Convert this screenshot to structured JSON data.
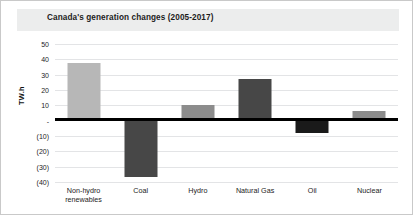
{
  "chart_data": {
    "type": "bar",
    "title": "Canada's generation changes (2005-2017)",
    "xlabel": "",
    "ylabel": "TW.h",
    "categories": [
      "Non-hydro renewables",
      "Coal",
      "Hydro",
      "Natural Gas",
      "Oil",
      "Nuclear"
    ],
    "values": [
      37.5,
      -36.5,
      10,
      27,
      -8,
      6
    ],
    "bar_colors": [
      "#b7b7b7",
      "#474747",
      "#8c8c8c",
      "#474747",
      "#1a1a1a",
      "#8c8c8c"
    ],
    "ylim": [
      -40,
      50
    ],
    "ytick_values": [
      50,
      40,
      30,
      20,
      10,
      0,
      -10,
      -20,
      -30,
      -40
    ],
    "ytick_labels": [
      "50",
      "40",
      "30",
      "20",
      "10",
      "-",
      "(10)",
      "(20)",
      "(30)",
      "(40)"
    ],
    "grid": true,
    "legend": "none",
    "zero_line": true
  },
  "colors": {
    "title_band": "#eceded",
    "zero_line": "#000000",
    "gridline": "#e3e4e6",
    "frame_border": "#c9c9c9",
    "text": "#1c1c1c"
  }
}
